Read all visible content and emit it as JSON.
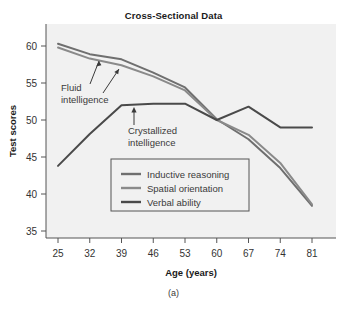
{
  "figure": {
    "title": "Cross-Sectional Data",
    "caption": "(a)"
  },
  "chart_data": {
    "type": "line",
    "title": "Cross-Sectional Data",
    "xlabel": "Age (years)",
    "ylabel": "Test scores",
    "x": [
      25,
      32,
      39,
      46,
      53,
      60,
      67,
      74,
      81
    ],
    "categories": [
      "25",
      "32",
      "39",
      "46",
      "53",
      "60",
      "67",
      "74",
      "81"
    ],
    "xlim": [
      25,
      81
    ],
    "ylim": [
      33.5,
      61.5
    ],
    "yticks": [
      35,
      40,
      45,
      50,
      55,
      60
    ],
    "ytick_labels": [
      "35",
      "40",
      "45",
      "50",
      "55",
      "60"
    ],
    "xticks": [
      25,
      32,
      39,
      46,
      53,
      60,
      67,
      74,
      81
    ],
    "grid": false,
    "legend_position": "center-left-inside",
    "plot_background": "#f1f1f1",
    "series": [
      {
        "name": "Inductive reasoning",
        "color": "#6f6f6f",
        "values": [
          60.3,
          58.9,
          58.2,
          56.4,
          54.4,
          50.1,
          47.4,
          43.5,
          38.4
        ]
      },
      {
        "name": "Spatial orientation",
        "color": "#8a8a8a",
        "values": [
          59.8,
          58.3,
          57.4,
          55.9,
          54.0,
          50.0,
          48.0,
          44.2,
          38.6
        ]
      },
      {
        "name": "Verbal ability",
        "color": "#4a4a4a",
        "values": [
          43.8,
          48.1,
          52.0,
          52.2,
          52.2,
          50.0,
          51.8,
          49.0,
          49.0
        ]
      }
    ],
    "annotations": [
      {
        "id": "fluid-intelligence",
        "line1": "Fluid",
        "line2": "intelligence",
        "text": "Fluid intelligence"
      },
      {
        "id": "crystallized-intelligence",
        "line1": "Crystallized",
        "line2": "intelligence",
        "text": "Crystallized intelligence"
      }
    ]
  },
  "legend": {
    "items": [
      {
        "label": "Inductive reasoning",
        "color": "#6f6f6f"
      },
      {
        "label": "Spatial orientation",
        "color": "#8a8a8a"
      },
      {
        "label": "Verbal ability",
        "color": "#4a4a4a"
      }
    ]
  }
}
